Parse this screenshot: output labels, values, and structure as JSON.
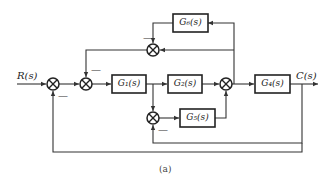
{
  "diagram": {
    "type": "block-diagram",
    "input_label": "R(s)",
    "output_label": "C(s)",
    "caption": "(a)",
    "blocks": [
      {
        "id": "G1",
        "label": "G₁(s)"
      },
      {
        "id": "G2",
        "label": "G₂(s)"
      },
      {
        "id": "G4",
        "label": "G₄(s)"
      },
      {
        "id": "G5",
        "label": "G₅(s)"
      },
      {
        "id": "G6",
        "label": "G₆(s)"
      }
    ],
    "summing_junctions": [
      {
        "id": "S1",
        "minus_sign": "—"
      },
      {
        "id": "S2",
        "minus_sign": "—"
      },
      {
        "id": "S3"
      },
      {
        "id": "S4",
        "minus_sign": "—"
      },
      {
        "id": "S5",
        "minus_sign": "—"
      }
    ],
    "connections": [
      "R(s) -> S1",
      "S1 -> S2",
      "S2 -> G1",
      "G1 -> G2",
      "G2 -> S3",
      "S3 -> G4",
      "G4 -> C(s)",
      "G1 output -> S5 (+)",
      "C(s) -> S5 (-)",
      "S5 -> G5",
      "G5 -> S3 (+)",
      "S3 output -> G6",
      "G6 -> S4 (-)",
      "S3 output -> S4 (+)",
      "S4 -> S2 (-)",
      "C(s) -> S1 (-)"
    ]
  }
}
